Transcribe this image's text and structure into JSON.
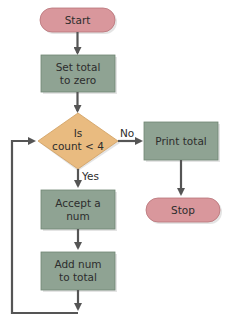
{
  "colors": {
    "terminal_fill": "#d9979c",
    "terminal_stroke": "#b87479",
    "process_fill": "#8fa393",
    "process_stroke": "#6f8573",
    "decision_fill": "#e9bb80",
    "decision_stroke": "#cf9e60",
    "arrow": "#555555",
    "shadow": "#e4e4e4"
  },
  "nodes": {
    "start": {
      "label": "Start"
    },
    "set_total": {
      "line1": "Set total",
      "line2": "to zero"
    },
    "decision": {
      "line1": "Is",
      "line2": "count < 4"
    },
    "print_total": {
      "label": "Print total"
    },
    "stop": {
      "label": "Stop"
    },
    "accept": {
      "line1": "Accept a",
      "line2": "num"
    },
    "add": {
      "line1": "Add num",
      "line2": "to total"
    }
  },
  "edges": {
    "no_label": "No",
    "yes_label": "Yes"
  }
}
